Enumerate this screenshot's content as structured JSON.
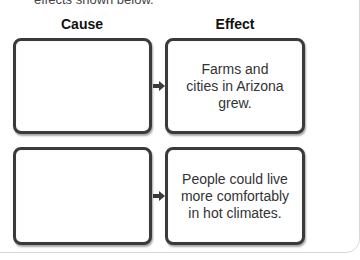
{
  "instructions_fragment": "effects shown below.",
  "headers": {
    "cause": "Cause",
    "effect": "Effect"
  },
  "rows": [
    {
      "cause": "",
      "effect": "Farms and cities in Arizona grew."
    },
    {
      "cause": "",
      "effect": "People could live more comfortably in hot climates."
    }
  ],
  "colors": {
    "border": "#3a3a3a",
    "text": "#333333",
    "header": "#111111"
  }
}
